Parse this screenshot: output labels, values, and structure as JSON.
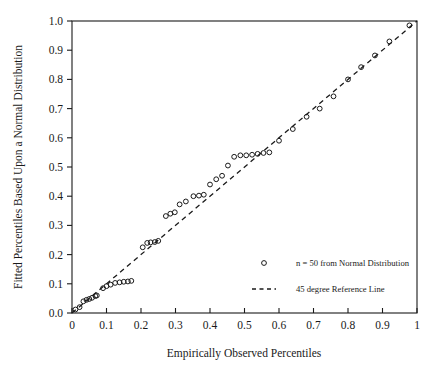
{
  "chart_data": {
    "type": "scatter",
    "title": "",
    "xlabel": "Empirically Observed Percentiles",
    "ylabel": "Fitted Percentiles Based Upon a Normal Distribution",
    "xlim": [
      0,
      1
    ],
    "ylim": [
      0,
      1
    ],
    "grid": false,
    "xticks": [
      "0",
      "0.1",
      "0.2",
      "0.3",
      "0.4",
      "0.5",
      "0.6",
      "0.7",
      "0.8",
      "0.9",
      "1"
    ],
    "xtick_values": [
      0,
      0.1,
      0.2,
      0.3,
      0.4,
      0.5,
      0.6,
      0.7,
      0.8,
      0.9,
      1
    ],
    "yticks": [
      "0.0",
      "0.1",
      "0.2",
      "0.3",
      "0.4",
      "0.5",
      "0.6",
      "0.7",
      "0.8",
      "0.9",
      "1.0"
    ],
    "ytick_values": [
      0,
      0.1,
      0.2,
      0.3,
      0.4,
      0.5,
      0.6,
      0.7,
      0.8,
      0.9,
      1
    ],
    "legend_position": "center-right-inside",
    "series": [
      {
        "name": "n = 50 from Normal Distribution",
        "type": "scatter",
        "marker": "open-circle",
        "points": [
          [
            0.01,
            0.012
          ],
          [
            0.022,
            0.02
          ],
          [
            0.033,
            0.04
          ],
          [
            0.042,
            0.045
          ],
          [
            0.05,
            0.048
          ],
          [
            0.058,
            0.052
          ],
          [
            0.068,
            0.058
          ],
          [
            0.072,
            0.06
          ],
          [
            0.09,
            0.085
          ],
          [
            0.1,
            0.092
          ],
          [
            0.112,
            0.097
          ],
          [
            0.125,
            0.103
          ],
          [
            0.138,
            0.105
          ],
          [
            0.15,
            0.107
          ],
          [
            0.162,
            0.108
          ],
          [
            0.172,
            0.11
          ],
          [
            0.205,
            0.225
          ],
          [
            0.218,
            0.24
          ],
          [
            0.228,
            0.242
          ],
          [
            0.24,
            0.243
          ],
          [
            0.25,
            0.247
          ],
          [
            0.272,
            0.332
          ],
          [
            0.285,
            0.34
          ],
          [
            0.298,
            0.345
          ],
          [
            0.312,
            0.372
          ],
          [
            0.33,
            0.382
          ],
          [
            0.352,
            0.4
          ],
          [
            0.368,
            0.402
          ],
          [
            0.382,
            0.405
          ],
          [
            0.4,
            0.44
          ],
          [
            0.418,
            0.458
          ],
          [
            0.435,
            0.47
          ],
          [
            0.452,
            0.505
          ],
          [
            0.47,
            0.535
          ],
          [
            0.488,
            0.54
          ],
          [
            0.505,
            0.54
          ],
          [
            0.522,
            0.542
          ],
          [
            0.538,
            0.545
          ],
          [
            0.555,
            0.548
          ],
          [
            0.572,
            0.55
          ],
          [
            0.6,
            0.59
          ],
          [
            0.64,
            0.63
          ],
          [
            0.68,
            0.672
          ],
          [
            0.718,
            0.7
          ],
          [
            0.758,
            0.742
          ],
          [
            0.8,
            0.8
          ],
          [
            0.838,
            0.842
          ],
          [
            0.878,
            0.882
          ],
          [
            0.92,
            0.93
          ],
          [
            0.978,
            0.985
          ]
        ]
      },
      {
        "name": "45 degree Reference Line",
        "type": "line",
        "style": "dashed",
        "x": [
          0,
          1
        ],
        "y": [
          0,
          1
        ]
      }
    ],
    "legend_entries": [
      {
        "label": "n = 50 from Normal Distribution",
        "marker": "open-circle"
      },
      {
        "label": "45 degree Reference Line",
        "marker": "dashed-line"
      }
    ]
  }
}
